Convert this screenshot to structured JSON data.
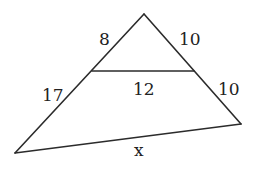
{
  "diagram": {
    "type": "triangle-with-parallel-segment",
    "colors": {
      "stroke": "#2b2b2b",
      "text": "#222222",
      "background": "#ffffff"
    },
    "vertices": {
      "apex": [
        144,
        14
      ],
      "bottom_left": [
        15,
        153
      ],
      "bottom_right": [
        241,
        124
      ],
      "mid_left": [
        92,
        71
      ],
      "mid_right": [
        194,
        71
      ]
    },
    "labels": {
      "upper_left_side": "8",
      "upper_right_side": "10",
      "lower_left_side": "17",
      "midsegment": "12",
      "lower_right_side": "10",
      "base": "x"
    }
  }
}
